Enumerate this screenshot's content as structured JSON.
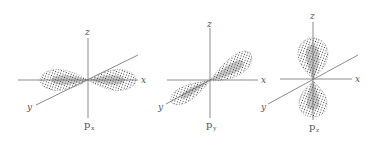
{
  "figure": {
    "colors": {
      "ink": "#555555",
      "axis": "#6e6e6e",
      "dots": "#333333",
      "background": "#ffffff"
    },
    "panels": [
      {
        "id": "px",
        "caption_main": "p",
        "caption_sub": "x",
        "axis_labels": {
          "z": "z",
          "x": "x",
          "y": "y"
        },
        "orientation": "lobes along x axis"
      },
      {
        "id": "py",
        "caption_main": "p",
        "caption_sub": "y",
        "axis_labels": {
          "z": "z",
          "x": "x",
          "y": "y"
        },
        "orientation": "lobes along y axis"
      },
      {
        "id": "pz",
        "caption_main": "p",
        "caption_sub": "z",
        "axis_labels": {
          "z": "z",
          "x": "x",
          "y": "y"
        },
        "orientation": "lobes along z axis"
      }
    ]
  }
}
